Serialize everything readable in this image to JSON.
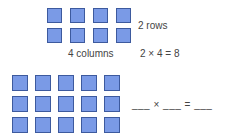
{
  "top": {
    "rows": 2,
    "columns": 4,
    "rows_label": "2 rows",
    "columns_label": "4 columns",
    "equation": "2 × 4 = 8"
  },
  "bottom": {
    "rows": 3,
    "columns": 5,
    "equation": "___ × ___ = ___"
  },
  "colors": {
    "square_fill": "#7a9ae6",
    "square_border": "#3d5a9e"
  }
}
